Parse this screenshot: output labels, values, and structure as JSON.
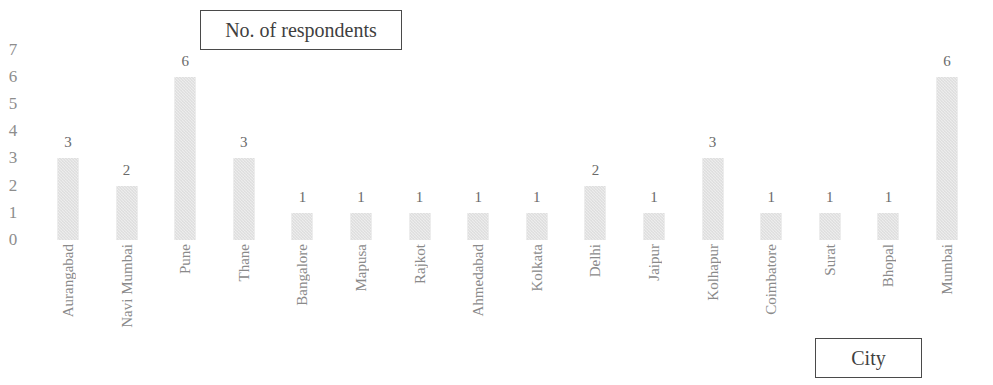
{
  "legend": {
    "series_title": "No. of respondents",
    "axis_title": "City"
  },
  "chart_data": {
    "type": "bar",
    "title": "No. of respondents",
    "xlabel": "City",
    "ylabel": "",
    "ylim": [
      0,
      7
    ],
    "yticks": [
      7,
      6,
      5,
      4,
      3,
      2,
      1,
      0
    ],
    "grid": false,
    "legend_position": "top-center-box",
    "bar_color": "#dddddd",
    "categories": [
      "Aurangabad",
      "Navi Mumbai",
      "Pune",
      "Thane",
      "Bangalore",
      "Mapusa",
      "Rajkot",
      "Ahmedabad",
      "Kolkata",
      "Delhi",
      "Jaipur",
      "Kolhapur",
      "Coimbatore",
      "Surat",
      "Bhopal",
      "Mumbai"
    ],
    "values": [
      3,
      2,
      6,
      3,
      1,
      1,
      1,
      1,
      1,
      2,
      1,
      3,
      1,
      1,
      1,
      6
    ],
    "series": [
      {
        "name": "No. of respondents",
        "values": [
          3,
          2,
          6,
          3,
          1,
          1,
          1,
          1,
          1,
          2,
          1,
          3,
          1,
          1,
          1,
          6
        ]
      }
    ]
  }
}
